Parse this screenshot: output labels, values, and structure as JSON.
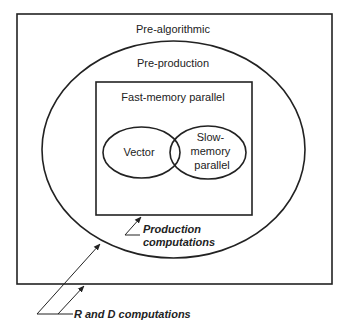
{
  "diagram": {
    "regions": {
      "outer": {
        "label": "Pre-algorithmic"
      },
      "ellipse": {
        "label": "Pre-production"
      },
      "inner_rect": {
        "label": "Fast-memory parallel"
      },
      "left_circle": {
        "label": "Vector"
      },
      "right_circle": {
        "label_lines": [
          "Slow-",
          "memory",
          "parallel"
        ]
      }
    },
    "annotations": {
      "production": {
        "lines": [
          "Production",
          "computations"
        ]
      },
      "r_and_d": {
        "label": "R and D computations"
      }
    },
    "colors": {
      "stroke": "#222222",
      "background": "#ffffff"
    }
  }
}
